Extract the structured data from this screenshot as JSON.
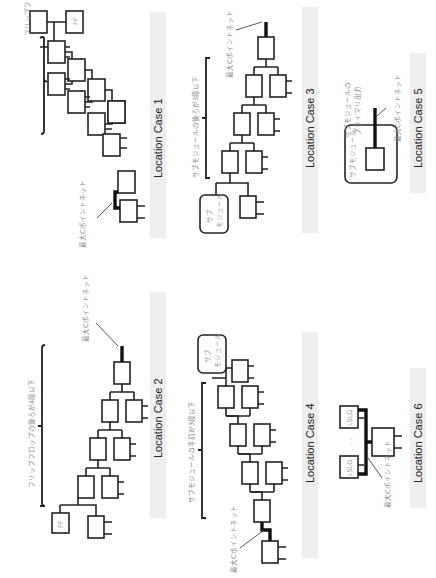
{
  "cases": [
    {
      "id": 1,
      "caption": "Location Case 1",
      "brace_label": "フリップフロップの手前が4段以下",
      "net_label": "最大Cポイントネット",
      "ff_label": "FF"
    },
    {
      "id": 2,
      "caption": "Location Case 2",
      "brace_label": "フリップフロップの後ろが4段以下",
      "net_label": "最大Cポイントネット",
      "ff_label": "FF"
    },
    {
      "id": 3,
      "caption": "Location Case 3",
      "brace_label": "サブモジュールの後ろが3段以下",
      "net_label": "最大Cポイントネット",
      "submodule_label_line1": "サブ",
      "submodule_label_line2": "モジュール"
    },
    {
      "id": 4,
      "caption": "Location Case 4",
      "brace_label": "サブモジュールの手前が3段以下",
      "net_label": "最大Cポイントネット",
      "submodule_label_line1": "サブ",
      "submodule_label_line2": "モジュール"
    },
    {
      "id": 5,
      "caption": "Location Case 5",
      "submodule_label": "サブモジュール",
      "output_label_line1": "サブモジュールの",
      "output_label_line2": "プライマリ出力",
      "net_label": "最大Cポイントネット"
    },
    {
      "id": 6,
      "caption": "Location Case 6",
      "cell_label": "LSLG",
      "ellipsis": "…",
      "net_label": "最大Cポイントネット"
    }
  ]
}
